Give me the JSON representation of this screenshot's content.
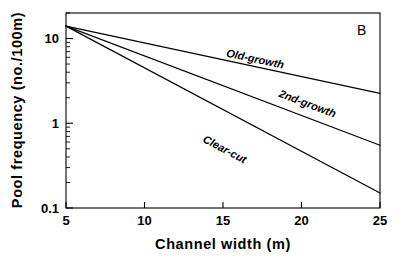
{
  "chart_data": {
    "type": "line",
    "title": "",
    "panel_label": "B",
    "xlabel": "Channel width (m)",
    "ylabel": "Pool frequency (no./100m)",
    "xlim": [
      5,
      25
    ],
    "ylim": [
      0.1,
      20
    ],
    "yscale": "log",
    "xscale": "linear",
    "grid": false,
    "legend": "inline-labels",
    "xticks": [
      5,
      10,
      15,
      20,
      25
    ],
    "xtick_labels": [
      "5",
      "10",
      "15",
      "20",
      "25"
    ],
    "yticks": [
      0.1,
      1,
      10
    ],
    "ytick_labels": [
      "0.1",
      "1",
      "10"
    ],
    "y_minor_ticks": [
      0.2,
      0.3,
      0.4,
      0.5,
      0.6,
      0.7,
      0.8,
      0.9,
      2,
      3,
      4,
      5,
      6,
      7,
      8,
      9,
      20
    ],
    "series": [
      {
        "name": "Old-growth",
        "label": "Old-growth",
        "x": [
          5,
          25
        ],
        "values": [
          14.0,
          2.25
        ],
        "label_x": 17.0,
        "label_y": 5.2
      },
      {
        "name": "2nd-growth",
        "label": "2nd-growth",
        "x": [
          5,
          25
        ],
        "values": [
          14.0,
          0.55
        ],
        "label_x": 20.3,
        "label_y": 1.55
      },
      {
        "name": "Clear-cut",
        "label": "Clear-cut",
        "x": [
          5,
          25
        ],
        "values": [
          14.0,
          0.15
        ],
        "label_x": 15.0,
        "label_y": 0.45
      }
    ],
    "annotations": [
      {
        "text": "B",
        "x": 24.0,
        "y": 15.5
      }
    ]
  },
  "figure": {
    "caption": "",
    "background_color": "#ffffff",
    "line_color": "#000000"
  }
}
